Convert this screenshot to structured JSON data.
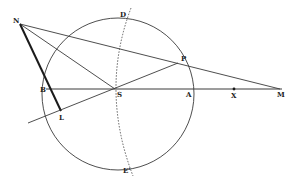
{
  "diagram": {
    "colors": {
      "ink": "#3a3a3a",
      "heavy": "#1a1a1a",
      "background": "#ffffff"
    },
    "circle": {
      "cx": 118,
      "cy": 94,
      "r": 76
    },
    "points": {
      "N": {
        "label": "N",
        "x": 20,
        "y": 24,
        "lx": 13,
        "ly": 23
      },
      "D": {
        "label": "D",
        "x": 127,
        "y": 16,
        "lx": 120,
        "ly": 17
      },
      "P": {
        "label": "P",
        "x": 178,
        "y": 63,
        "lx": 181,
        "ly": 61
      },
      "B": {
        "label": "B",
        "x": 48,
        "y": 89,
        "lx": 40,
        "ly": 92
      },
      "S": {
        "label": "S",
        "x": 115,
        "y": 89,
        "lx": 117,
        "ly": 97
      },
      "A": {
        "label": "A",
        "x": 189,
        "y": 89,
        "lx": 186,
        "ly": 97
      },
      "X": {
        "label": "X",
        "x": 234,
        "y": 89,
        "lx": 231,
        "ly": 97
      },
      "M": {
        "label": "M",
        "x": 280,
        "y": 89,
        "lx": 277,
        "ly": 97
      },
      "L": {
        "label": "L",
        "x": 61,
        "y": 111,
        "lx": 59,
        "ly": 120
      },
      "E": {
        "label": "E'",
        "x": 129,
        "y": 170,
        "lx": 123,
        "ly": 172
      }
    },
    "labels": [
      "N",
      "D",
      "P",
      "B",
      "S",
      "A",
      "X",
      "M",
      "L",
      "E'"
    ]
  }
}
